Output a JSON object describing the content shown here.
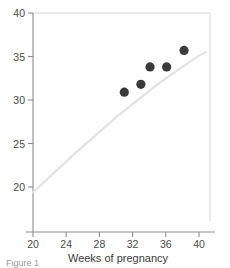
{
  "chart_data": {
    "type": "scatter",
    "title": "",
    "subtitle": "",
    "xlabel": "Weeks of pregnancy",
    "ylabel": "",
    "xlim": [
      20,
      40.8
    ],
    "ylim": [
      16.2,
      40
    ],
    "xticks": [
      20,
      24,
      28,
      32,
      36,
      40
    ],
    "yticks": [
      20,
      25,
      30,
      35,
      40
    ],
    "xtick_labels": [
      "20",
      "24",
      "28",
      "32",
      "36",
      "40"
    ],
    "ytick_labels": [
      "20",
      "25",
      "30",
      "35",
      "40"
    ],
    "grid": false,
    "legend": null,
    "annotations": [],
    "point_color": "#3a3a3a",
    "curve_color": "#e2e2e2",
    "axis_color": "#8c8c8c",
    "frame_color": "#d5d5d5",
    "points": [
      {
        "x": 31.0,
        "y": 30.9
      },
      {
        "x": 33.0,
        "y": 31.8
      },
      {
        "x": 34.1,
        "y": 33.8
      },
      {
        "x": 36.1,
        "y": 33.8
      },
      {
        "x": 38.2,
        "y": 35.7
      }
    ],
    "series": [
      {
        "name": "observations",
        "type": "scatter",
        "x": [
          31.0,
          33.0,
          34.1,
          36.1,
          38.2
        ],
        "values": [
          30.9,
          31.8,
          33.8,
          33.8,
          35.7
        ]
      },
      {
        "name": "reference-curve",
        "type": "line",
        "x": [
          20.0,
          22.5,
          25.0,
          27.5,
          30.0,
          32.5,
          35.0,
          37.5,
          40.0,
          40.8
        ],
        "values": [
          19.4,
          21.6,
          23.8,
          25.9,
          28.0,
          29.9,
          31.8,
          33.5,
          35.1,
          35.5
        ]
      }
    ]
  },
  "caption": {
    "text": "Figure 1"
  }
}
